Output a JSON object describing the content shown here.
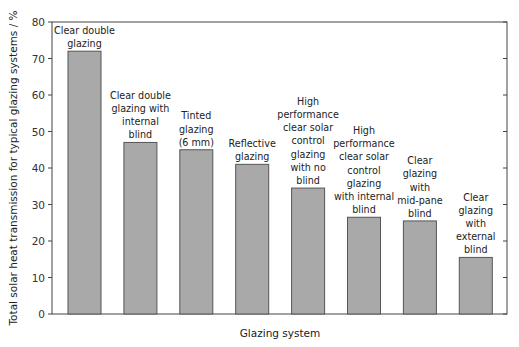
{
  "chart_data": {
    "type": "bar",
    "title": "",
    "xlabel": "Glazing system",
    "ylabel": "Total solar heat transmission for typical glazing systems / %",
    "ylim": [
      0,
      80
    ],
    "yticks": [
      0,
      10,
      20,
      30,
      40,
      50,
      60,
      70,
      80
    ],
    "grid": false,
    "legend": null,
    "categories": [
      "Clear double glazing",
      "Clear double glazing with internal blind",
      "Tinted glazing (6 mm)",
      "Reflective glazing",
      "High performance clear solar control glazing with no blind",
      "High performance clear solar control glazing with internal blind",
      "Clear glazing with mid-pane blind",
      "Clear glazing with external blind"
    ],
    "category_label_lines": [
      [
        "Clear double",
        "glazing"
      ],
      [
        "Clear double",
        "glazing with",
        "internal",
        "blind"
      ],
      [
        "Tinted",
        "glazing",
        "(6 mm)"
      ],
      [
        "Reflective",
        "glazing"
      ],
      [
        "High",
        "performance",
        "clear solar",
        "control",
        "glazing",
        "with no",
        "blind"
      ],
      [
        "High",
        "performance",
        "clear solar",
        "control",
        "glazing",
        "with internal",
        "blind"
      ],
      [
        "Clear",
        "glazing",
        "with",
        "mid-pane",
        "blind"
      ],
      [
        "Clear",
        "glazing",
        "with",
        "external",
        "blind"
      ]
    ],
    "values": [
      72,
      47,
      45,
      41,
      34.5,
      26.5,
      25.5,
      15.5
    ],
    "colors": {
      "bar_fill": "#a9a9a9",
      "bar_stroke": "#555555",
      "axis": "#444444"
    }
  }
}
